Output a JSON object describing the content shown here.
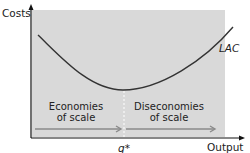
{
  "diagram": {
    "y_axis_label": "Costs",
    "x_axis_label": "Output",
    "curve_label": "LAC",
    "min_point_label": "q*",
    "left_zone": {
      "line1": "Economies",
      "line2": "of scale"
    },
    "right_zone": {
      "line1": "Diseconomies",
      "line2": "of scale"
    },
    "colors": {
      "panel": "#d9d9d9",
      "curve": "#333333",
      "arrow": "#8a8a8a",
      "axis": "#111111",
      "divider": "#ffffff"
    }
  }
}
